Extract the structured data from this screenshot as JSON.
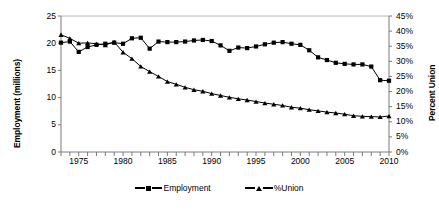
{
  "chart_data": {
    "type": "line",
    "title": "",
    "xlabel": "",
    "ylabel": "Employment (millions)",
    "y2label": "Percent Union",
    "xlim": [
      1973,
      2010
    ],
    "ylim": [
      0,
      25
    ],
    "y2lim": [
      0,
      45
    ],
    "grid": false,
    "legend_position": "bottom",
    "x_tick_labels": [
      "1975",
      "1980",
      "1985",
      "1990",
      "1995",
      "2000",
      "2005",
      "2010"
    ],
    "x_tick_values": [
      1975,
      1980,
      1985,
      1990,
      1995,
      2000,
      2005,
      2010
    ],
    "y_tick_labels": [
      "0",
      "5",
      "10",
      "15",
      "20",
      "25"
    ],
    "y_tick_values": [
      0,
      5,
      10,
      15,
      20,
      25
    ],
    "y2_tick_labels": [
      "0%",
      "5%",
      "10%",
      "15%",
      "20%",
      "25%",
      "30%",
      "35%",
      "40%",
      "45%"
    ],
    "y2_tick_values": [
      0,
      5,
      10,
      15,
      20,
      25,
      30,
      35,
      40,
      45
    ],
    "x": [
      1973,
      1974,
      1975,
      1976,
      1977,
      1978,
      1979,
      1980,
      1981,
      1982,
      1983,
      1984,
      1985,
      1986,
      1987,
      1988,
      1989,
      1990,
      1991,
      1992,
      1993,
      1994,
      1995,
      1996,
      1997,
      1998,
      1999,
      2000,
      2001,
      2002,
      2003,
      2004,
      2005,
      2006,
      2007,
      2008,
      2009,
      2010
    ],
    "series": [
      {
        "name": "Employment",
        "axis": "left",
        "marker": "square",
        "color": "#000000",
        "values": [
          20.1,
          20.3,
          18.4,
          19.3,
          19.7,
          19.9,
          20.1,
          19.9,
          20.9,
          21.0,
          19.0,
          20.3,
          20.2,
          20.2,
          20.3,
          20.5,
          20.6,
          20.4,
          19.6,
          18.6,
          19.2,
          19.1,
          19.4,
          19.8,
          20.1,
          20.2,
          19.9,
          19.7,
          18.7,
          17.4,
          16.9,
          16.4,
          16.2,
          16.1,
          16.1,
          15.7,
          13.2,
          13.1
        ]
      },
      {
        "name": "%Union",
        "axis": "right",
        "marker": "triangle",
        "color": "#000000",
        "values": [
          38.8,
          37.6,
          36.0,
          36.1,
          35.8,
          35.4,
          36.4,
          33.0,
          30.9,
          28.3,
          26.6,
          25.0,
          23.3,
          22.4,
          21.4,
          20.6,
          20.1,
          19.3,
          18.7,
          18.1,
          17.6,
          17.2,
          16.7,
          16.2,
          15.8,
          15.4,
          14.8,
          14.5,
          14.0,
          13.6,
          13.2,
          12.9,
          12.5,
          12.0,
          11.8,
          11.7,
          11.6,
          11.9
        ]
      }
    ]
  },
  "legend": {
    "items": [
      {
        "label": "Employment",
        "marker": "square"
      },
      {
        "label": "%Union",
        "marker": "triangle"
      }
    ]
  }
}
